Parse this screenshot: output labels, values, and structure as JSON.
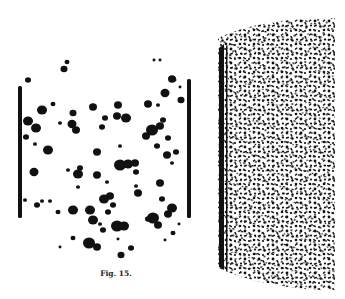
{
  "figure": {
    "caption": "Fig. 15.",
    "ink_color": "#111111",
    "paper_color": "#ffffff",
    "panels": [
      {
        "name": "left-specimen",
        "description": "cylinder outline with scattered coarse black blobs",
        "bars": [
          {
            "x": 18,
            "y": 86,
            "w": 4,
            "h": 132
          },
          {
            "x": 187,
            "y": 79,
            "w": 4,
            "h": 139
          }
        ],
        "blobs": [
          [
            67,
            62,
            2.5
          ],
          [
            64,
            69,
            3.5
          ],
          [
            28,
            80,
            3
          ],
          [
            154,
            60,
            1.5
          ],
          [
            160,
            60,
            1.5
          ],
          [
            172,
            79,
            4
          ],
          [
            165,
            93,
            4.5
          ],
          [
            181,
            100,
            3.5
          ],
          [
            175,
            80,
            1.5
          ],
          [
            180,
            87,
            1.5
          ],
          [
            42,
            110,
            5
          ],
          [
            53,
            104,
            2.5
          ],
          [
            73,
            113,
            3.5
          ],
          [
            72,
            124,
            4.5
          ],
          [
            76,
            130,
            4
          ],
          [
            93,
            107,
            4
          ],
          [
            118,
            105,
            4
          ],
          [
            117,
            116,
            4
          ],
          [
            126,
            118,
            5
          ],
          [
            105,
            118,
            3
          ],
          [
            102,
            127,
            3
          ],
          [
            148,
            104,
            4
          ],
          [
            158,
            105,
            2
          ],
          [
            28,
            121,
            5
          ],
          [
            36,
            128,
            5
          ],
          [
            26,
            137,
            3
          ],
          [
            35,
            144,
            2
          ],
          [
            60,
            123,
            2
          ],
          [
            48,
            150,
            5
          ],
          [
            34,
            172,
            4.5
          ],
          [
            68,
            170,
            2
          ],
          [
            78,
            174,
            5
          ],
          [
            80,
            168,
            3
          ],
          [
            97,
            152,
            4
          ],
          [
            120,
            146,
            2
          ],
          [
            120,
            165,
            6
          ],
          [
            128,
            164,
            5
          ],
          [
            135,
            163,
            4
          ],
          [
            136,
            172,
            3
          ],
          [
            152,
            130,
            6
          ],
          [
            146,
            136,
            4
          ],
          [
            160,
            126,
            4
          ],
          [
            163,
            120,
            3
          ],
          [
            157,
            146,
            3
          ],
          [
            167,
            155,
            4
          ],
          [
            168,
            138,
            3
          ],
          [
            176,
            152,
            3
          ],
          [
            172,
            163,
            2
          ],
          [
            97,
            175,
            4
          ],
          [
            107,
            182,
            2
          ],
          [
            25,
            200,
            2
          ],
          [
            42,
            201,
            2
          ],
          [
            37,
            205,
            3
          ],
          [
            50,
            201,
            2
          ],
          [
            58,
            212,
            2.5
          ],
          [
            73,
            210,
            5
          ],
          [
            90,
            210,
            5
          ],
          [
            93,
            220,
            5
          ],
          [
            104,
            199,
            5
          ],
          [
            110,
            196,
            4
          ],
          [
            113,
            205,
            3
          ],
          [
            108,
            212,
            3
          ],
          [
            138,
            193,
            4
          ],
          [
            136,
            186,
            2
          ],
          [
            160,
            183,
            4
          ],
          [
            162,
            199,
            3
          ],
          [
            172,
            208,
            5
          ],
          [
            168,
            214,
            4
          ],
          [
            153,
            218,
            6
          ],
          [
            158,
            225,
            4
          ],
          [
            148,
            219,
            3
          ],
          [
            117,
            226,
            6
          ],
          [
            124,
            226,
            5
          ],
          [
            100,
            224,
            2
          ],
          [
            103,
            230,
            3
          ],
          [
            173,
            233,
            2.5
          ],
          [
            179,
            224,
            1.5
          ],
          [
            73,
            238,
            2.5
          ],
          [
            89,
            243,
            6
          ],
          [
            97,
            247,
            4
          ],
          [
            118,
            239,
            1.5
          ],
          [
            131,
            248,
            3
          ],
          [
            121,
            255,
            3.5
          ],
          [
            60,
            247,
            1.5
          ],
          [
            165,
            240,
            1.5
          ],
          [
            78,
            187,
            2
          ]
        ]
      },
      {
        "name": "right-specimen",
        "description": "cylindrical section covered in fine dense speckle texture",
        "region": {
          "x": 218,
          "y": 18,
          "w": 117,
          "h": 272
        }
      }
    ]
  }
}
